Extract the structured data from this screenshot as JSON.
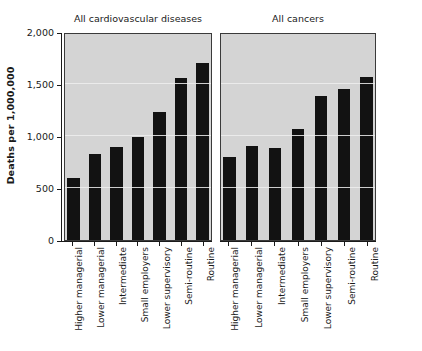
{
  "chart_data": {
    "type": "bar",
    "title": "",
    "xlabel": "",
    "ylabel": "Deaths per 1,000,000",
    "ylim": [
      0,
      2000
    ],
    "yticks": [
      0,
      500,
      1000,
      1500,
      2000
    ],
    "ytick_labels": [
      "0",
      "500",
      "1,000",
      "1,500",
      "2,000"
    ],
    "grid": true,
    "legend": "none",
    "panels": [
      {
        "title": "All cardiovascular diseases",
        "categories": [
          "Higher managerial",
          "Lower managerial",
          "Intermediate",
          "Small employers",
          "Lower supervisory",
          "Semi-routine",
          "Routine"
        ],
        "values": [
          600,
          830,
          890,
          990,
          1230,
          1560,
          1700
        ]
      },
      {
        "title": "All cancers",
        "categories": [
          "Higher managerial",
          "Lower managerial",
          "Intermediate",
          "Small employers",
          "Lower supervisory",
          "Semi-routine",
          "Routine"
        ],
        "values": [
          800,
          900,
          880,
          1070,
          1380,
          1450,
          1570
        ]
      }
    ],
    "colors": {
      "bar": "#121212",
      "plot_background": "#d4d4d4",
      "panel_border": "#3a3a3a",
      "gridline": "#efefef",
      "axis": "#1a1a1a",
      "figure_background": "#ffffff"
    }
  }
}
